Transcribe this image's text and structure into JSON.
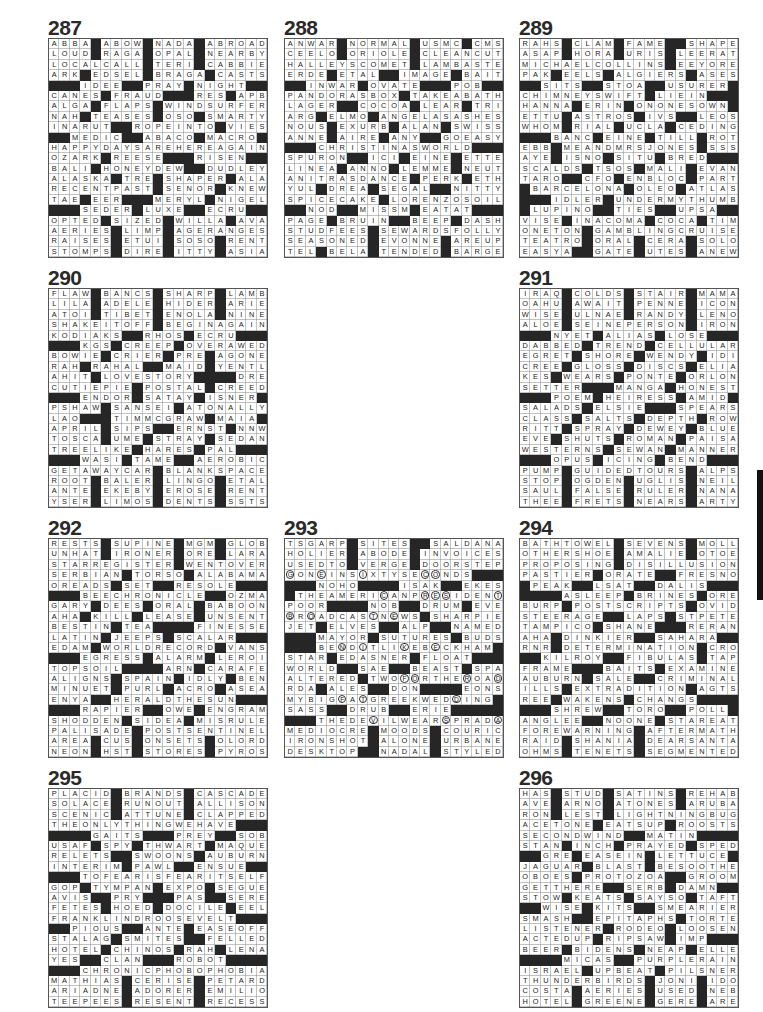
{
  "page": {
    "type": "crossword-solutions-page"
  },
  "puzzles": [
    {
      "number": "287",
      "rows": [
        "ABBA#ABOW#NADA#ABROAD",
        "LOUD#RAGA#OPAL#NEARBY",
        "LOCALCALL#TERI#CABBIE",
        "ARK#EDSEL#BRAGA#CASTS",
        "###IDEE##PRAY#NIGHT##",
        "CANES#FRAUD###RES#APB",
        "ALGA#FLAPS#WINDSURFER",
        "NAH#TEASES#OSO#SMARTY",
        "INARUT##ROPEINTO#VIES",
        "##MEDIC##ABACO#MACRO#",
        "HAPPYDAYSAREHEREAGAIN",
        "OZARK#REESE###RISEN##",
        "BALI#HONEYDEW##DUDLEY",
        "ALASKA#TRE#SHAPER#ALA",
        "RECENTPAST#SENOR#KNEW",
        "TAE#EER###MERYL#NIGEL",
        "###SEDER#LUXE##ECRU##",
        "OPTED#SIZED#WILLA#AVA",
        "AERIES#LIMP#AGERANGES",
        "RAISES#ETUI#SOSO#RENT",
        "STOMPS#DIRE#ITTY#ASIA"
      ]
    },
    {
      "number": "288",
      "rows": [
        "ANWAR#NORMAL#USMC#CMS",
        "CEELO#ORIOLE#CLEANCUT",
        "HALLEYSCOMET#LAMBASTE",
        "ERDE#ETAL##IMAGE#BAIT",
        "##INWAR#OVATE###POB##",
        "PANDORASBOX#TAKEABATH",
        "LAGER##COCOA#LEAR#TRI",
        "ARG#ELMO#ANGELASASHES",
        "NOUS#EXURB#ALAN#SWISS",
        "ANNE#AIRE#ANY##GOEASY",
        "###CHRISTINASWORLD###",
        "SPURON##ICI#EINE#ETTE",
        "LINEA#ANNO#LEMME#NEUT",
        "ANITRASDANCE#PERK#ETH",
        "YUL#DREA#SEGAL##NITTY",
        "SPICECAKE#LORENZOSOIL",
        "##NOD##MISSM#EATAT###",
        "PAGE#BRUIN##BEEP#DASH",
        "STUDFEES#SEWARDSFOLLY",
        "SEASONED#EVONNE#AREUP",
        "TEL#BELA#TENDED#BARGE"
      ]
    },
    {
      "number": "289",
      "rows": [
        "RAHS#CLAM#FAME##SHAPE",
        "ASAP#HORA#URIS#LEERAT",
        "MICHAELCOLLINS#EEYORE",
        "PAK#EELS#ALGIERS#ASES",
        "##SITS##STOA##USURER#",
        "CHIMNEYSWIFT#LIEIN###",
        "HANNA#ERIN#ONONESOWN#",
        "ETTU#ASTROS#IVS##LEOS",
        "WHOM#RIAL#UCLA#CEDING",
        "###BANC#EINE#TILL#ROT",
        "EBB#MEANDMRSJONES#SSS",
        "AYE#ISNO#SITU#BRED###",
        "SCALDS#TSOS#MALI#EVAN",
        "TARO##CFO#ENBLOC#PART",
        "#BARCELONA#OLEO#ATLAS",
        "###IDLER#UNDERMYTHUMB",
        "#LUPINO##TIES##UPSA##",
        "VISE#INACOMA#COCA#TIM",
        "ONETON#GAMBLINGCRUISE",
        "TEATRO#ORAL#CERA#SOLO",
        "EASYA##GATE#UTES#ANEW"
      ]
    },
    {
      "number": "290",
      "rows": [
        "FLAW#BANCS#SHARP#LAMB",
        "LILA#ADELE#HIDER#ARIE",
        "ATOI#TIBET#ENOLA#NINE",
        "SHAKEITOFF#BEGINAGAIN",
        "KODIAKS##RHOS#ECRU###",
        "###KGS#CREEP#OVERAWED",
        "BOWIE#CRIER#PRE#AGONE",
        "RAH#RAHAL##MAID#YENTL",
        "AHIT#LOVESTORY####DRE",
        "CUTIEPIE#POSTAL#CREED",
        "###ENDOR#SATAY#ISNER#",
        "PSHAW#SANSEI#ATONALLY",
        "LAO###TIMMCGRAW#MAIA#",
        "APRIL#SIPS##ERNST#NNW",
        "TOSCA#UME#STRAY#SEDAN",
        "TREELIKE#HARES#PAL###",
        "###WASI#TAME##AEROBIC",
        "GETAWAYCAR#BLANKSPACE",
        "ROOT#BALER#LINGO#ETAL",
        "ANTE#EKEBY#EROSE#RENT",
        "YSER#LIMOS#DENTS#SSTS"
      ]
    },
    {
      "number": "291",
      "rows": [
        "IRAQ#COLDS#STAIR#MAMA",
        "OAHU#AWAIT#PENNE#ICON",
        "WISE#ULNAE#RANDY#LENO",
        "ALOE#SEINEPERSON#IRON",
        "###NYET#ALIAS#LOSE###",
        "DABBED#TREND#CELLULAR",
        "EGRET#SHORE#WENDY#IDI",
        "CREE#GLOSS#DISCS#ELIA",
        "KES#WEARS#PONTE#ORLON",
        "SETTER###MANGA#HONEST",
        "###POEM#HEIRESS#AMID#",
        "SALADS#ELSIE###SPEARS",
        "CLASS#SALTS#DEPTH#ROW",
        "RITT#SPRAY#DEWEY#BLUE",
        "EVE#SHUTS#ROMAN#PAISA",
        "WESTERNS#SEWAN#MANNER",
        "###OPUS#ICING#BEND###",
        "PUMP#GUIDEDTOURS#ALPS",
        "STOP#OGDEN#UGLIS#NEIL",
        "SAUL#FALSE#RULER#NANA",
        "THEE#FRETS#NEARS#ARTY"
      ]
    },
    {
      "number": "292",
      "rows": [
        "RESTS#SUPINE#MGM#GLOB",
        "UNHAT#IRONER#ORE#LARA",
        "STARREGISTER#WENTOVER",
        "SERBIAN#TORSO#ALABAMA",
        "OREADS#SET##RESOLE###",
        "###BEECHRONICLE##OZMA",
        "GARY#DEES#ORAL#BABOON",
        "AHA#KILL#LEASE#UNSENT",
        "BESTIN#TEA####FINESSE",
        "LATIN#JEEPS#SCALAR###",
        "EDAM#WORLDRECORD#VANS",
        "###EGRESS#ALARM#LEROI",
        "TOPSOIL####ARN#CARAFE",
        "ALIGNS#SPAIN#IDLY#BEN",
        "MINUET#PURL#ACRO#ASEA",
        "ENYA##HERALDTHESUN###",
        "###RAPIER##OWE#ENGRAM",
        "SHODDEN#SIDEA#MISRULE",
        "PALISADE#POSTSENTINEL",
        "AREA#CUS#ONSETS#OLORD",
        "NEON#HST#STORES#PYROS"
      ]
    },
    {
      "number": "293",
      "rows": [
        "TSGARP#SITES##SALDANA",
        "HOLIER#ABODE#INVOICES",
        "USEDTO#VERGE#DOORSTEP",
        "gONeINSiXTYSEcoNDS###",
        "###NOHO####ISAK##EKES",
        "#THEAMERIcANPresIDENt",
        "POOR####NOB##DRUM#EVE",
        "bRoADCAStNeWS#SHARPIE",
        "JET#ELVES##ALP##NAMED",
        "###MAYOR#SUTURES#BUDS",
        "###BEnDiTLIkEBeCKHAM#",
        "STAR#EDASNER#FLOAT###",
        "WORLD##SAE##BEAST#SPA",
        "ALTERED#TWOfoRTHErOAd",
        "RDA#ALES##DON####EONS",
        "MYBIGfAtGREEKWEDdING#",
        "SASS##DRUB##ERIE#####",
        "###THEDEvILWEARsPRADa",
        "MEDIOCRE#MOODS#COURIC",
        "IRONSHOT#ALONE#URBANE",
        "DESKTOP##NADAL#STYLED"
      ]
    },
    {
      "number": "294",
      "rows": [
        "BATHTOWEL#SEVENS#MOLL",
        "OTHERSHOE#AMALIE#OTOE",
        "PROPOSING#DISILLUSION",
        "PASTIER#ORATE##FRESNO",
        "#PEAK##LSAT##DALIS###",
        "####ASLEEP#BRINES#ORE",
        "BURP#POSTSCRIPTS#OVID",
        "STEERAGE##LAPS#STPETE",
        "TAMPICO#SHANE###RERAN",
        "AHA#DINKIER##SAHARA##",
        "RNR#DETERMINATION#CRO",
        "##KILROY##FIBULAS#TAP",
        "FRAME###BAITS#EXAMINE",
        "AUBURN#SALE##CRIMINAL",
        "ILLS#EXTRADITION#AGTS",
        "REE#WAKENS#CHANGS####",
        "###SHREW##TORO##POLL#",
        "ANGLEE##NOONE#STAREAT",
        "FOREWARNING#AFTERMATH",
        "RAID#SHANIA#DEARSANTA",
        "OHMS#TENETS#SEGMENTED"
      ]
    },
    {
      "number": "295",
      "rows": [
        "PLACID#BRANDS#CASCADE",
        "SOLACE#RUNOUT#ALLISON",
        "SCENIC#ATTUNE#CLAPPED",
        "THEONLYTHINGWEHAVE###",
        "####GAITS###PREY##SOB",
        "USAF#SPY#THWART#MAQUE",
        "RELETS##SWOONS#AUBURN",
        "INTERIM#PAWL##ENSUE##",
        "###TOFEARISFEARITSELF",
        "GOP#TYMPAN#EXPO#SEGUE",
        "AVIS##PRY###PAS##SERE",
        "FETES#HOED#DOCILE#EEL",
        "FRANKLINDROOSEVELT###",
        "##PIOUS##ANTE#EASEOFF",
        "STALAG#SMITES##FELLED",
        "HOTEL#CHINOS#RAH#LENA",
        "YES##CLAN###ROBOT####",
        "###CHRONICPHOBOPHOBIA",
        "MATHIAS#CERISE#PETARD",
        "ARIADNE#ADORER#EMILIO",
        "TEEPEES#RESENT#RECESS"
      ]
    },
    {
      "number": "296",
      "rows": [
        "HAS#STUD#SATINS#REHAB",
        "AVE#ARNO#ATONES#ARUBA",
        "RON#LEST#LIGHTNINGBUG",
        "ACETONE#EATSUP#ROOSTS",
        "SECONDWIND##MATIN####",
        "STAN#INCH#PRAYED#SPED",
        "##GRE#EASEIN#LETTUCE#",
        "JAGUAR#BLAST#BESOOTHE",
        "OBOES#PROTOZOA##GROOM",
        "GETTHERE##SERB#DAMN##",
        "STOW#KEATS#SAYSO#TAFT",
        "##WISE#KITS##SMEARIER",
        "SMASH##EPITAPHS#TORTE",
        "LISTENER#RODEO#LOOSEN",
        "ACTEDUP#RIPSAW#IMP###",
        "BEER#BIDENS#NEAP#ELLE",
        "####MICAS##PURPLERAIN",
        "ISRAEL#UPBEAT#PILSNER",
        "THUNDERBIRDS#JONI#IDO",
        "COSTA#AERIES#USED#NEB",
        "HOTEL#GREENE#GERE#ARE"
      ]
    }
  ]
}
